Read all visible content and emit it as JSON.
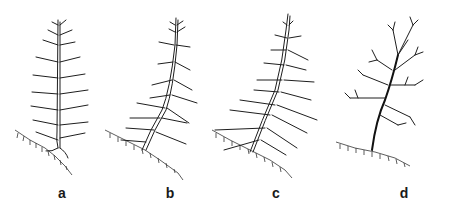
{
  "figure": {
    "panels": [
      {
        "id": "a",
        "label": "a",
        "description": "young conifer with regular horizontal branch whorls on slope"
      },
      {
        "id": "b",
        "label": "b",
        "description": "conifer with slightly leaning trunk and drooping branches"
      },
      {
        "id": "c",
        "label": "c",
        "description": "leaning conifer with long drooping branches"
      },
      {
        "id": "d",
        "label": "d",
        "description": "broad-crowned tree with spreading irregular branches"
      }
    ],
    "colors": {
      "line": "#1e1e1e",
      "background": "#ffffff"
    }
  }
}
